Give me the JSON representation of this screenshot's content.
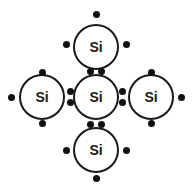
{
  "diagram": {
    "element_symbol": "Si",
    "background_color": "#ffffff",
    "stroke_color": "#1a1a1a",
    "dot_color": "#101010",
    "atoms": [
      {
        "id": "atom-top",
        "label": "Si",
        "cx": 96,
        "cy": 47,
        "r": 23
      },
      {
        "id": "atom-left",
        "label": "Si",
        "cx": 42,
        "cy": 97,
        "r": 23
      },
      {
        "id": "atom-center",
        "label": "Si",
        "cx": 96,
        "cy": 97,
        "r": 23
      },
      {
        "id": "atom-right",
        "label": "Si",
        "cx": 151,
        "cy": 97,
        "r": 23
      },
      {
        "id": "atom-bottom",
        "label": "Si",
        "cx": 96,
        "cy": 150,
        "r": 23
      }
    ],
    "electron_dots": [
      {
        "id": "dot-top-atom-top",
        "x": 96,
        "y": 14,
        "kind": "lone"
      },
      {
        "id": "dot-top-atom-left",
        "x": 66,
        "y": 44,
        "kind": "lone"
      },
      {
        "id": "dot-top-atom-right",
        "x": 126,
        "y": 44,
        "kind": "lone"
      },
      {
        "id": "dot-bond-top-center-a",
        "x": 90,
        "y": 71,
        "kind": "bonding-pair"
      },
      {
        "id": "dot-bond-top-center-b",
        "x": 101,
        "y": 71,
        "kind": "bonding-pair"
      },
      {
        "id": "dot-left-atom-top",
        "x": 42,
        "y": 72,
        "kind": "lone"
      },
      {
        "id": "dot-left-atom-left",
        "x": 11,
        "y": 97,
        "kind": "lone"
      },
      {
        "id": "dot-left-atom-bottom",
        "x": 42,
        "y": 123,
        "kind": "lone"
      },
      {
        "id": "dot-bond-left-center-a",
        "x": 70,
        "y": 91,
        "kind": "bonding-pair"
      },
      {
        "id": "dot-bond-left-center-b",
        "x": 70,
        "y": 102,
        "kind": "bonding-pair"
      },
      {
        "id": "dot-bond-center-right-a",
        "x": 122,
        "y": 91,
        "kind": "bonding-pair"
      },
      {
        "id": "dot-bond-center-right-b",
        "x": 122,
        "y": 102,
        "kind": "bonding-pair"
      },
      {
        "id": "dot-right-atom-top",
        "x": 151,
        "y": 72,
        "kind": "lone"
      },
      {
        "id": "dot-right-atom-right",
        "x": 181,
        "y": 97,
        "kind": "lone"
      },
      {
        "id": "dot-right-atom-bottom",
        "x": 151,
        "y": 123,
        "kind": "lone"
      },
      {
        "id": "dot-bond-center-bottom-a",
        "x": 90,
        "y": 124,
        "kind": "bonding-pair"
      },
      {
        "id": "dot-bond-center-bottom-b",
        "x": 101,
        "y": 124,
        "kind": "bonding-pair"
      },
      {
        "id": "dot-bottom-atom-left",
        "x": 66,
        "y": 150,
        "kind": "lone"
      },
      {
        "id": "dot-bottom-atom-right",
        "x": 126,
        "y": 150,
        "kind": "lone"
      },
      {
        "id": "dot-bottom-atom-bottom",
        "x": 96,
        "y": 178,
        "kind": "lone"
      }
    ]
  }
}
